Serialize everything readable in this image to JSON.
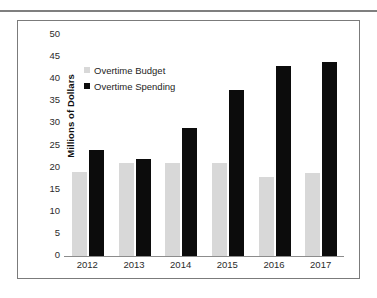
{
  "chart_data": {
    "type": "bar",
    "title": "",
    "xlabel": "",
    "ylabel": "Millions of Dollars",
    "categories": [
      "2012",
      "2013",
      "2014",
      "2015",
      "2016",
      "2017"
    ],
    "series": [
      {
        "name": "Overtime Budget",
        "color": "#d8d8d8",
        "values": [
          19,
          21,
          21,
          21,
          17.8,
          18.7
        ]
      },
      {
        "name": "Overtime Spending",
        "color": "#0c0c0c",
        "values": [
          24,
          22,
          29,
          37.5,
          43,
          44
        ]
      }
    ],
    "ylim": [
      0,
      50
    ],
    "ytick_step": 5,
    "yticks": [
      "50",
      "45",
      "40",
      "35",
      "30",
      "25",
      "20",
      "15",
      "10",
      "5",
      "0"
    ],
    "grid": false,
    "legend_position": "inside-top-left"
  },
  "frame": {
    "border_color": "#7b7b7b",
    "rule_color": "#7f7f7f"
  }
}
